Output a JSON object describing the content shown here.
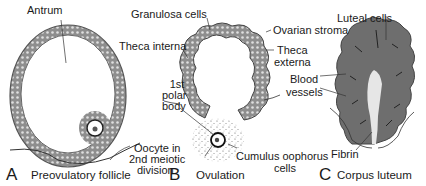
{
  "panels": [
    {
      "letter": "A",
      "caption": "Preovulatory follicle",
      "labels": {
        "antrum": "Antrum",
        "oocyte_line1": "Oocyte in",
        "oocyte_line2": "2nd meiotic",
        "oocyte_line3": "division"
      }
    },
    {
      "letter": "B",
      "caption": "Ovulation",
      "labels": {
        "granulosa": "Granulosa cells",
        "theca_interna": "Theca interna",
        "polar_line1": "1st",
        "polar_line2": "polar",
        "polar_line3": "body",
        "cumulus_line1": "Cumulus oophorus",
        "cumulus_line2": "cells",
        "ovarian_stroma": "Ovarian stroma",
        "theca_externa_line1": "Theca",
        "theca_externa_line2": "externa"
      }
    },
    {
      "letter": "C",
      "caption": "Corpus luteum",
      "labels": {
        "luteal": "Luteal cells",
        "blood_line1": "Blood",
        "blood_line2": "vessels",
        "fibrin": "Fibrin"
      }
    }
  ],
  "colors": {
    "tissue_dark": "#6e6e6e",
    "tissue_mid": "#9a9a9a",
    "tissue_light": "#c8c8c8",
    "line": "#333333",
    "background": "#ffffff"
  }
}
